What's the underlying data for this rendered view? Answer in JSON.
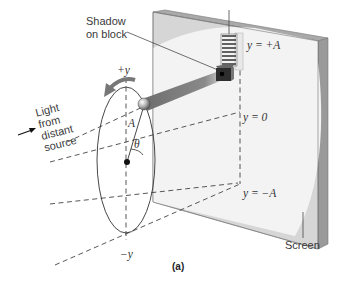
{
  "figure": {
    "caption": "(a)",
    "labels": {
      "shadow_line1": "Shadow",
      "shadow_line2": "on block",
      "light_line1": "Light",
      "light_line2": "from",
      "light_line3": "distant",
      "light_line4": "source",
      "plus_y": "+y",
      "minus_y": "−y",
      "amplitude": "A",
      "theta": "θ",
      "y_plus_a": "y = +A",
      "y_zero": "y = 0",
      "y_minus_a": "y = −A",
      "screen": "Screen"
    },
    "colors": {
      "screen_face": "#f2f2f2",
      "screen_shadow": "#cfcfcf",
      "screen_edge": "#8c8c8c",
      "rod": "#7d7d7d",
      "line": "#333333"
    }
  }
}
